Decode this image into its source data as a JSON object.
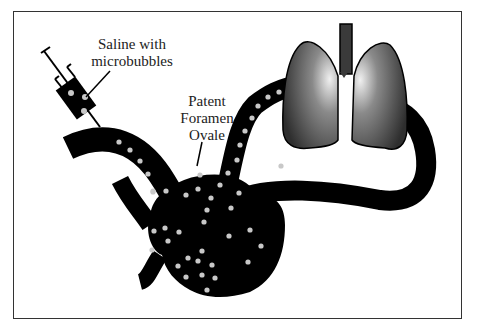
{
  "diagram": {
    "labels": {
      "saline_line1": "Saline with",
      "saline_line2": "microbubbles",
      "pfo_line1": "Patent",
      "pfo_line2": "Foramen",
      "pfo_line3": "Ovale"
    },
    "colors": {
      "vessel": "#000000",
      "bubble": "#c8c8c8",
      "lung_dark": "#2a2a2a",
      "lung_light": "#e8e8e8",
      "frame": "#333333"
    }
  }
}
